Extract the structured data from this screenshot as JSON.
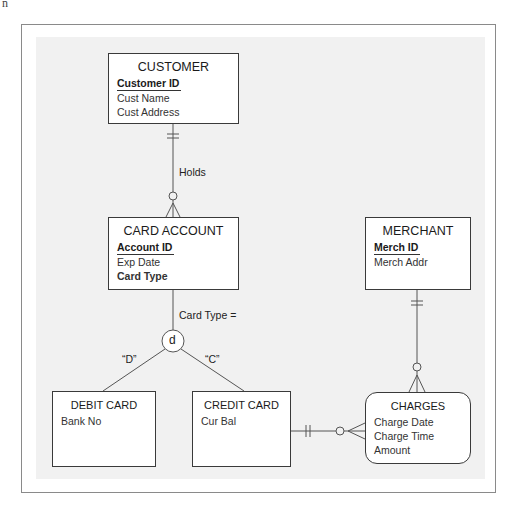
{
  "corner_text": "n",
  "entities": {
    "customer": {
      "title": "CUSTOMER",
      "attributes": [
        {
          "name": "Customer ID",
          "key": true
        },
        {
          "name": "Cust Name",
          "key": false
        },
        {
          "name": "Cust Address",
          "key": false
        }
      ]
    },
    "card_account": {
      "title": "CARD ACCOUNT",
      "attributes": [
        {
          "name": "Account ID",
          "key": true
        },
        {
          "name": "Exp Date",
          "key": false
        },
        {
          "name": "Card Type",
          "key": false,
          "bold": true
        }
      ]
    },
    "merchant": {
      "title": "MERCHANT",
      "attributes": [
        {
          "name": "Merch ID",
          "key": true
        },
        {
          "name": "Merch Addr",
          "key": false
        }
      ]
    },
    "debit_card": {
      "title": "DEBIT CARD",
      "attributes": [
        {
          "name": "Bank No",
          "key": false
        }
      ]
    },
    "credit_card": {
      "title": "CREDIT CARD",
      "attributes": [
        {
          "name": "Cur Bal",
          "key": false
        }
      ]
    },
    "charges": {
      "title": "CHARGES",
      "associative": true,
      "attributes": [
        {
          "name": "Charge Date",
          "key": false
        },
        {
          "name": "Charge Time",
          "key": false
        },
        {
          "name": "Amount",
          "key": false
        }
      ]
    }
  },
  "relationships": {
    "holds": {
      "label": "Holds",
      "from": "CUSTOMER",
      "to": "CARD ACCOUNT",
      "from_cardinality": "one-and-only-one",
      "to_cardinality": "zero-or-many"
    },
    "merchant_charges": {
      "from": "MERCHANT",
      "to": "CHARGES",
      "from_cardinality": "one-and-only-one",
      "to_cardinality": "zero-or-many"
    },
    "credit_charges": {
      "from": "CREDIT CARD",
      "to": "CHARGES",
      "from_cardinality": "one-and-only-one",
      "to_cardinality": "zero-or-many"
    }
  },
  "subtype": {
    "discriminator_label": "Card Type =",
    "symbol": "d",
    "branches": [
      {
        "value": "“D”",
        "entity": "DEBIT CARD"
      },
      {
        "value": "“C”",
        "entity": "CREDIT CARD"
      }
    ]
  }
}
